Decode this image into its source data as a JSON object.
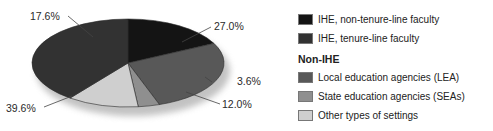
{
  "chart_data": {
    "type": "pie",
    "title": "",
    "slices": [
      {
        "label": "IHE, non-tenure-line faculty",
        "value": 17.6,
        "display": "17.6%",
        "color": "#141414"
      },
      {
        "label": "Local education agencies (LEA)",
        "value": 27.0,
        "display": "27.0%",
        "color": "#585858"
      },
      {
        "label": "State education agencies (SEAs)",
        "value": 3.6,
        "display": "3.6%",
        "color": "#8f8f8f"
      },
      {
        "label": "Other types of settings",
        "value": 12.0,
        "display": "12.0%",
        "color": "#cfcfcf"
      },
      {
        "label": "IHE, tenure-line faculty",
        "value": 39.6,
        "display": "39.6%",
        "color": "#323232"
      }
    ],
    "legend": {
      "position": "right",
      "items": [
        {
          "label": "IHE, non-tenure-line faculty",
          "color": "#141414"
        },
        {
          "label": "IHE, tenure-line faculty",
          "color": "#323232"
        }
      ],
      "group_title": "Non-IHE",
      "group_items": [
        {
          "label": "Local education agencies (LEA)",
          "color": "#585858"
        },
        {
          "label": "State education agencies (SEAs)",
          "color": "#8f8f8f"
        },
        {
          "label": "Other types of settings",
          "color": "#cfcfcf"
        }
      ]
    }
  }
}
